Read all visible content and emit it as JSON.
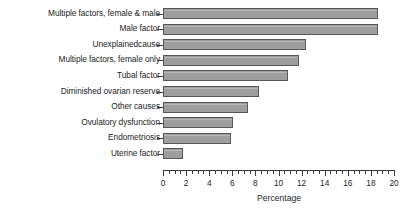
{
  "chart_data": {
    "type": "bar",
    "orientation": "horizontal",
    "title": "",
    "xlabel": "Percentage",
    "ylabel": "",
    "xlim": [
      0,
      20
    ],
    "grid": false,
    "legend": null,
    "categories": [
      "Multiple factors, female & male",
      "Male factor",
      "Unexplainedcause",
      "Multiple factors, female only",
      "Tubal factor",
      "Diminished ovarian reserve",
      "Other causes",
      "Ovulatory dysfunction",
      "Endometriosis",
      "Uterine factor"
    ],
    "values": [
      18.6,
      18.6,
      12.4,
      11.8,
      10.8,
      8.3,
      7.4,
      6.1,
      5.9,
      1.7
    ],
    "x_ticks_major": [
      0,
      2,
      4,
      6,
      8,
      10,
      12,
      14,
      16,
      18,
      20
    ],
    "x_tick_labels": [
      "0",
      "2",
      "4",
      "6",
      "8",
      "10",
      "12",
      "14",
      "16",
      "18",
      "20"
    ],
    "x_minor_tick_step": 0.5,
    "colors": {
      "bar_fill": "#9e9e9e",
      "bar_edge": "#575757",
      "axis": "#3b3b3b",
      "text": "#1c1c1c",
      "background": "#ffffff"
    }
  }
}
